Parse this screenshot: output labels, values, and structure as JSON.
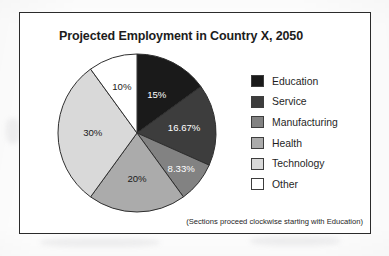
{
  "figure": {
    "title": "Projected Employment in Country X, 2050",
    "footnote": "(Sections proceed clockwise starting with Education)"
  },
  "legend": {
    "items": [
      {
        "label": "Education",
        "color": "#1a1a1a"
      },
      {
        "label": "Service",
        "color": "#3d3d3d"
      },
      {
        "label": "Manufacturing",
        "color": "#828282"
      },
      {
        "label": "Health",
        "color": "#ababab"
      },
      {
        "label": "Technology",
        "color": "#d9d9d9"
      },
      {
        "label": "Other",
        "color": "#ffffff"
      }
    ]
  },
  "chart_data": {
    "type": "pie",
    "title": "Projected Employment in Country X, 2050",
    "categories": [
      "Education",
      "Service",
      "Manufacturing",
      "Health",
      "Technology",
      "Other"
    ],
    "values": [
      15,
      16.67,
      8.33,
      20,
      30,
      10
    ],
    "labels": [
      "15%",
      "16.67%",
      "8.33%",
      "20%",
      "30%",
      "10%"
    ],
    "colors": [
      "#1a1a1a",
      "#3d3d3d",
      "#828282",
      "#ababab",
      "#d9d9d9",
      "#ffffff"
    ],
    "label_colors": [
      "#ffffff",
      "#ffffff",
      "#ffffff",
      "#1a1a1a",
      "#1a1a1a",
      "#1a1a1a"
    ],
    "unit": "%",
    "total": 100,
    "start_angle_deg": 0,
    "direction": "clockwise",
    "legend_position": "right",
    "annotation": "(Sections proceed clockwise starting with Education)"
  }
}
